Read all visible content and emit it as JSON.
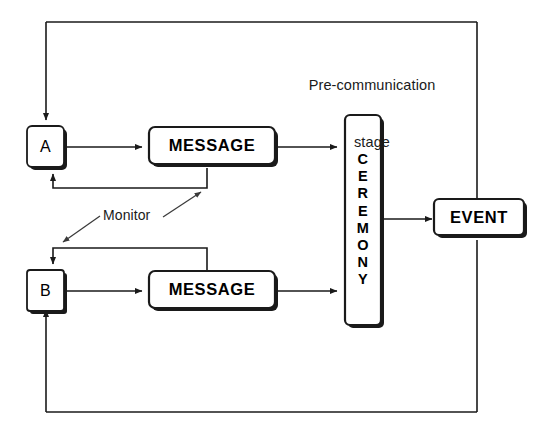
{
  "diagram": {
    "frame": {
      "name": "outer-feedback-frame"
    },
    "captions": {
      "stage_line1": "Pre-communication",
      "stage_line2": "stage",
      "monitor": "Monitor"
    },
    "nodes": {
      "a": {
        "label": "A",
        "shape": "rounded-square-shadow"
      },
      "b": {
        "label": "B",
        "shape": "rounded-square-shadow"
      },
      "message_top": {
        "label": "MESSAGE",
        "shape": "rounded-rect-shadow"
      },
      "message_bottom": {
        "label": "MESSAGE",
        "shape": "rounded-rect-shadow"
      },
      "ceremony": {
        "label": "CEREMONY",
        "letters": [
          "C",
          "E",
          "R",
          "E",
          "M",
          "O",
          "N",
          "Y"
        ],
        "shape": "vertical-rounded-rect-shadow"
      },
      "event": {
        "label": "EVENT",
        "shape": "rounded-rect-shadow"
      }
    },
    "connections": [
      {
        "name": "a-to-message-top",
        "from": "A",
        "to": "MESSAGE (top)",
        "style": "solid-arrow"
      },
      {
        "name": "message-top-to-ceremony",
        "from": "MESSAGE (top)",
        "to": "CEREMONY",
        "style": "solid-arrow"
      },
      {
        "name": "b-to-message-bottom",
        "from": "B",
        "to": "MESSAGE (bottom)",
        "style": "solid-arrow"
      },
      {
        "name": "message-bottom-to-ceremony",
        "from": "MESSAGE (bottom)",
        "to": "CEREMONY",
        "style": "solid-arrow"
      },
      {
        "name": "ceremony-to-event",
        "from": "CEREMONY",
        "to": "EVENT",
        "style": "solid-arrow"
      },
      {
        "name": "message-top-feedback-to-a",
        "from": "MESSAGE (top)",
        "to": "A",
        "style": "monitor-feedback-loop"
      },
      {
        "name": "message-bottom-feedback-to-b",
        "from": "MESSAGE (bottom)",
        "to": "B",
        "style": "monitor-feedback-loop"
      },
      {
        "name": "event-feedback-top-to-a",
        "from": "EVENT",
        "to": "A",
        "style": "outer-loop"
      },
      {
        "name": "event-feedback-bottom-to-b",
        "from": "EVENT",
        "to": "B",
        "style": "outer-loop"
      },
      {
        "name": "monitor-pointer-up",
        "from": "Monitor",
        "to": "MESSAGE (top) feedback line",
        "style": "thin-arrow"
      },
      {
        "name": "monitor-pointer-down",
        "from": "Monitor",
        "to": "MESSAGE (bottom) feedback line",
        "style": "thin-arrow"
      }
    ],
    "colors": {
      "ink": "#1a1a1a",
      "box_fill": "#ffffff",
      "box_stroke": "#000000",
      "background": "#ffffff"
    }
  }
}
